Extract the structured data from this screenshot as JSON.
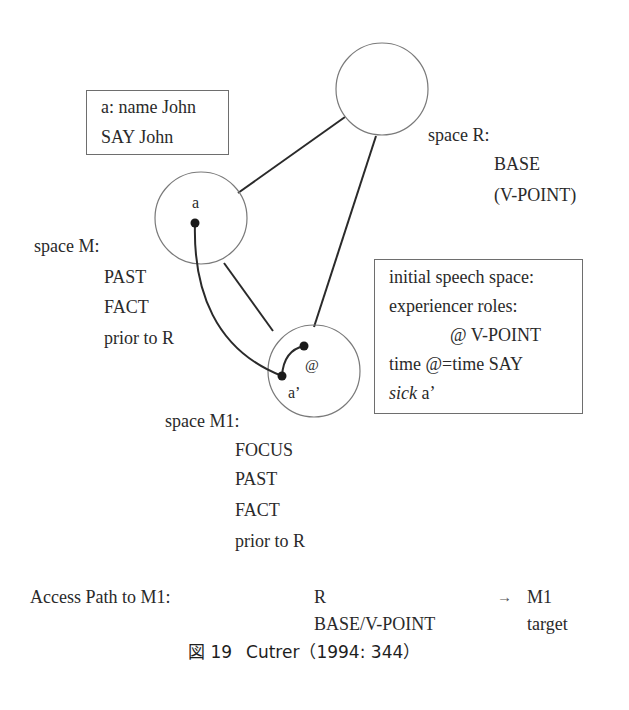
{
  "diagram": {
    "spaces": {
      "R": {
        "label": "space R:",
        "properties": [
          "BASE",
          "(V-POINT)"
        ]
      },
      "M": {
        "label": "space M:",
        "element": "a",
        "properties": [
          "PAST",
          "FACT",
          "prior to R"
        ]
      },
      "M1": {
        "label": "space M1:",
        "element": "a’",
        "viewpoint_marker": "@",
        "properties": [
          "FOCUS",
          "PAST",
          "FACT",
          "prior to R"
        ]
      }
    },
    "name_box": {
      "lines": [
        "a: name John",
        "SAY John"
      ]
    },
    "speech_box": {
      "lines": [
        "initial speech space:",
        "experiencer roles:",
        "@ V-POINT",
        "time @=time SAY"
      ],
      "last_line_italic": "sick",
      "last_line_rest": " a’"
    },
    "access_path": {
      "label": "Access Path to M1:",
      "from": "R",
      "from_role": "BASE/V-POINT",
      "arrow": "→",
      "to": "M1",
      "to_role": "target"
    },
    "colors": {
      "line": "#2a2a2a",
      "circle": "#7a7a7a",
      "box_border": "#6e6e6e"
    }
  },
  "caption": {
    "figure_label": "図 19",
    "text": "Cutrer（1994: 344）"
  }
}
